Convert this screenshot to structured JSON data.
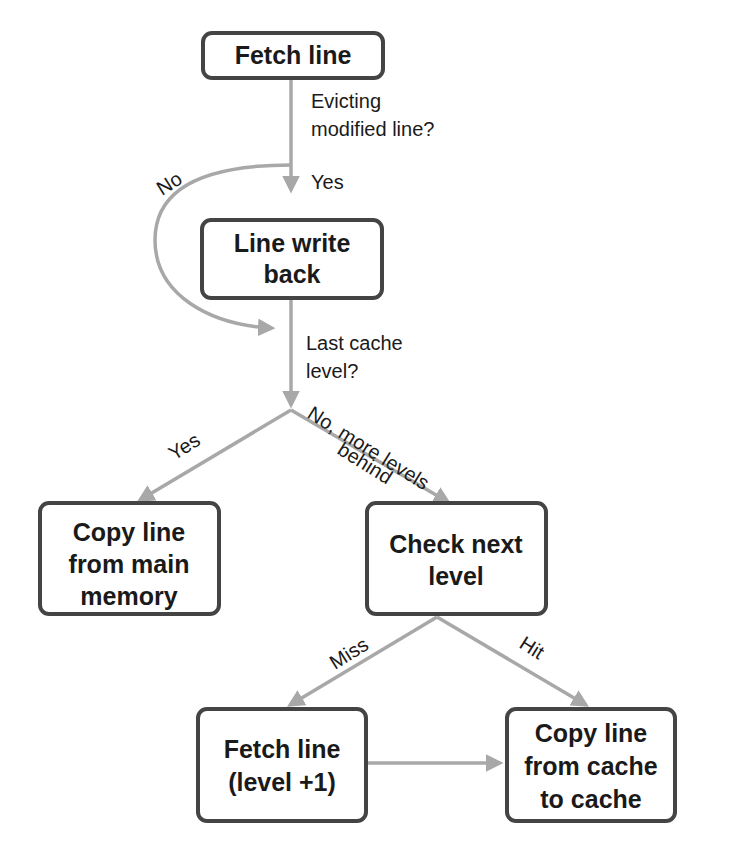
{
  "diagram": {
    "colors": {
      "node_border": "#444444",
      "edge": "#a8a8a8",
      "text": "#1a1a1a",
      "background": "#ffffff"
    },
    "nodes": {
      "fetch_line": {
        "line1": "Fetch line"
      },
      "line_write_back": {
        "line1": "Line write",
        "line2": "back"
      },
      "copy_from_main": {
        "line1": "Copy line",
        "line2": "from main",
        "line3": "memory"
      },
      "check_next_level": {
        "line1": "Check next",
        "line2": "level"
      },
      "fetch_line_next": {
        "line1": "Fetch line",
        "line2": "(level +1)"
      },
      "copy_cache_to_cache": {
        "line1": "Copy line",
        "line2": "from cache",
        "line3": "to cache"
      }
    },
    "edge_labels": {
      "evicting_q1": "Evicting",
      "evicting_q2": "modified line?",
      "yes_writeback": "Yes",
      "no_skip": "No",
      "last_level_q1": "Last cache",
      "last_level_q2": "level?",
      "yes_main": "Yes",
      "no_more_1": "No, more levels",
      "no_more_2": "behind",
      "miss": "Miss",
      "hit": "Hit"
    }
  }
}
